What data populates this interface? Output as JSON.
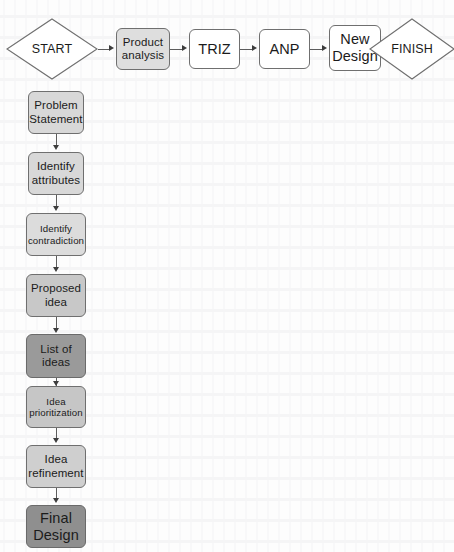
{
  "diagram": {
    "type": "flowchart",
    "title": "",
    "top_row": {
      "start": {
        "label": "START",
        "shape": "diamond",
        "fill": "#ffffff"
      },
      "steps": [
        {
          "label": "Product\nanalysis",
          "line1": "Product",
          "line2": "analysis",
          "fill": "#dedede"
        },
        {
          "label": "TRIZ",
          "line1": "TRIZ",
          "line2": "",
          "fill": "#ffffff"
        },
        {
          "label": "ANP",
          "line1": "ANP",
          "line2": "",
          "fill": "#ffffff"
        },
        {
          "label": "New Design",
          "line1": "New",
          "line2": "Design",
          "fill": "#ffffff"
        }
      ],
      "finish": {
        "label": "FINISH",
        "shape": "diamond",
        "fill": "#ffffff"
      }
    },
    "vertical_chain": [
      {
        "line1": "Problem",
        "line2": "Statement",
        "fill": "#d8d8d8",
        "size": "normal"
      },
      {
        "line1": "Identify",
        "line2": "attributes",
        "fill": "#d8d8d8",
        "size": "normal"
      },
      {
        "line1": "Identify",
        "line2": "contradiction",
        "fill": "#dcdcdc",
        "size": "small"
      },
      {
        "line1": "Proposed",
        "line2": "idea",
        "fill": "#c8c8c8",
        "size": "normal"
      },
      {
        "line1": "List of",
        "line2": "ideas",
        "fill": "#9a9a9a",
        "size": "normal"
      },
      {
        "line1": "Idea",
        "line2": "prioritization",
        "fill": "#c6c6c6",
        "size": "small"
      },
      {
        "line1": "Idea",
        "line2": "refinement",
        "fill": "#cfcfcf",
        "size": "normal"
      },
      {
        "line1": "Final",
        "line2": "Design",
        "fill": "#8f8f8f",
        "size": "big"
      }
    ],
    "colors": {
      "stroke": "#6f6f6f",
      "connector": "#5c5c5c",
      "arrowhead": "#3d3d3d",
      "text": "#1b1b1b",
      "page": "#fdfdfd"
    }
  }
}
